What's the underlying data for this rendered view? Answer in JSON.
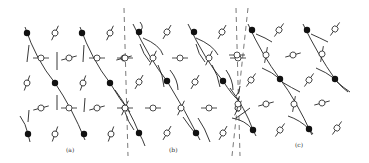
{
  "figure": {
    "colors": {
      "ink": "#222222",
      "background": "#ffffff",
      "dashed": "#555555"
    },
    "panels": [
      {
        "label": "(a)",
        "label_pos": [
          72,
          151
        ],
        "filled_dots": [
          [
            27,
            33
          ],
          [
            82,
            33
          ],
          [
            55,
            83
          ],
          [
            110,
            83
          ],
          [
            28,
            134
          ],
          [
            84,
            134
          ]
        ],
        "open_circles": [
          {
            "x": 55,
            "y": 33,
            "angle": -65
          },
          {
            "x": 110,
            "y": 33,
            "angle": -65
          },
          {
            "x": 41,
            "y": 58,
            "angle": 0
          },
          {
            "x": 69,
            "y": 58,
            "angle": -15
          },
          {
            "x": 97,
            "y": 58,
            "angle": 0
          },
          {
            "x": 124,
            "y": 58,
            "angle": -15
          },
          {
            "x": 27,
            "y": 83,
            "angle": -70
          },
          {
            "x": 83,
            "y": 83,
            "angle": -70
          },
          {
            "x": 41,
            "y": 108,
            "angle": -15
          },
          {
            "x": 69,
            "y": 108,
            "angle": 0
          },
          {
            "x": 97,
            "y": 108,
            "angle": -15
          },
          {
            "x": 125,
            "y": 108,
            "angle": 0
          },
          {
            "x": 55,
            "y": 134,
            "angle": -70
          },
          {
            "x": 111,
            "y": 134,
            "angle": -70
          }
        ],
        "curves": [
          "M25 27 Q 36 60 55 83 Q 72 108 85 140",
          "M80 27 Q 92 60 110 83 Q 120 100 130 112",
          "M29 45 L 27 62",
          "M57 52 L 57 70",
          "M84 45 L 83 62",
          "M57 95 L 57 110",
          "M29 110 L 28 122",
          "M85 98 L 84 112",
          "M20 116 Q 26 124 28 134 L 30 142"
        ]
      },
      {
        "label": "(b)",
        "label_pos": [
          175,
          151
        ],
        "filled_dots": [
          [
            139,
            32
          ],
          [
            194,
            32
          ],
          [
            167,
            81
          ],
          [
            223,
            81
          ],
          [
            139,
            133
          ],
          [
            196,
            133
          ]
        ],
        "open_circles": [
          {
            "x": 167,
            "y": 32,
            "angle": -60
          },
          {
            "x": 222,
            "y": 32,
            "angle": -60
          },
          {
            "x": 125,
            "y": 58,
            "angle": 0
          },
          {
            "x": 153,
            "y": 58,
            "angle": -65
          },
          {
            "x": 180,
            "y": 58,
            "angle": 0
          },
          {
            "x": 209,
            "y": 58,
            "angle": -65
          },
          {
            "x": 238,
            "y": 58,
            "angle": 0
          },
          {
            "x": 139,
            "y": 82,
            "angle": -60
          },
          {
            "x": 195,
            "y": 82,
            "angle": -60
          },
          {
            "x": 125,
            "y": 108,
            "angle": -65
          },
          {
            "x": 153,
            "y": 108,
            "angle": 0
          },
          {
            "x": 181,
            "y": 108,
            "angle": -65
          },
          {
            "x": 209,
            "y": 108,
            "angle": 0
          },
          {
            "x": 238,
            "y": 108,
            "angle": -65
          },
          {
            "x": 167,
            "y": 133,
            "angle": -60
          },
          {
            "x": 223,
            "y": 133,
            "angle": -60
          }
        ],
        "curves": [
          "M133 24 Q 150 60 167 81 Q 185 110 200 140",
          "M140 22 Q 145 28 139 32",
          "M188 24 Q 205 60 223 81 Q 232 95 240 102",
          "M143 38 Q 160 45 163 55",
          "M140 44 Q 143 54 150 62",
          "M158 65 Q 163 75 164 87",
          "M170 70 Q 178 80 178 90",
          "M196 38 Q 213 45 218 55",
          "M196 44 Q 198 54 205 62",
          "M212 65 Q 218 75 220 87",
          "M226 70 Q 233 80 233 90",
          "M115 90 Q 130 110 139 133 Q 143 140 145 146",
          "M125 112 Q 128 122 134 130",
          "M183 117 Q 190 127 195 133",
          "M198 118 Q 205 128 210 142",
          "M236 118 Q 245 112 250 108"
        ]
      },
      {
        "label": "(c)",
        "label_pos": [
          301,
          146
        ],
        "filled_dots": [
          [
            252,
            30
          ],
          [
            307,
            30
          ],
          [
            280,
            79
          ],
          [
            335,
            79
          ],
          [
            253,
            130
          ],
          [
            309,
            129
          ]
        ],
        "open_circles": [
          {
            "x": 279,
            "y": 30,
            "angle": -55
          },
          {
            "x": 335,
            "y": 29,
            "angle": -55
          },
          {
            "x": 237,
            "y": 55,
            "angle": 0
          },
          {
            "x": 266,
            "y": 55,
            "angle": -80
          },
          {
            "x": 293,
            "y": 55,
            "angle": -15
          },
          {
            "x": 322,
            "y": 54,
            "angle": -80
          },
          {
            "x": 251,
            "y": 80,
            "angle": -55
          },
          {
            "x": 309,
            "y": 80,
            "angle": -55
          },
          {
            "x": 238,
            "y": 104,
            "angle": -80
          },
          {
            "x": 266,
            "y": 104,
            "angle": -15
          },
          {
            "x": 294,
            "y": 104,
            "angle": -80
          },
          {
            "x": 322,
            "y": 103,
            "angle": -15
          },
          {
            "x": 280,
            "y": 130,
            "angle": -55
          },
          {
            "x": 337,
            "y": 128,
            "angle": -55
          }
        ],
        "curves": [
          "M248 24 Q 262 55 280 79 Q 296 100 312 135",
          "M256 34 Q 266 38 272 42",
          "M303 24 Q 318 55 335 79 Q 342 88 348 92",
          "M311 34 Q 320 38 328 42",
          "M262 68 Q 272 72 280 79",
          "M282 82 Q 292 88 300 92",
          "M316 68 Q 326 72 335 79",
          "M337 82 Q 344 88 350 92",
          "M230 88 Q 245 108 253 130 L 256 136",
          "M232 118 Q 245 120 253 130",
          "M288 116 Q 300 120 309 129 L 313 134",
          "M236 96 Q 240 92 240 86"
        ]
      }
    ],
    "dashed_lines": [
      {
        "x1": 124,
        "y1": 8,
        "x2": 128,
        "y2": 156
      },
      {
        "x1": 236,
        "y1": 8,
        "x2": 240,
        "y2": 156
      },
      {
        "x1": 248,
        "y1": 8,
        "x2": 232,
        "y2": 156
      }
    ]
  }
}
